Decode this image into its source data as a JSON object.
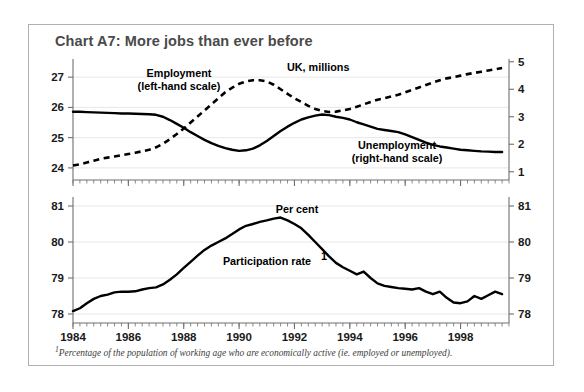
{
  "figure": {
    "title": "Chart A7: More jobs than ever before",
    "footnote_marker": "1",
    "footnote": "Percentage of the population of working age who are economically active (ie. employed or unemployed).",
    "border_color": "#b0b0b0",
    "title_color": "#4a4a4a"
  },
  "annotations": {
    "employment": "Employment",
    "employment_scale": "(left-hand scale)",
    "units_top": "UK, millions",
    "unemployment": "Unemployment",
    "unemployment_scale": "(right-hand scale)",
    "units_bottom": "Per cent",
    "participation": "Participation rate",
    "participation_marker": "1"
  },
  "chart_data": [
    {
      "type": "line",
      "title": "Employment and unemployment",
      "xlabel": "",
      "ylabel": "UK, millions",
      "xlim": [
        1984.0,
        1999.75
      ],
      "xticks": [
        1984,
        1986,
        1988,
        1990,
        1992,
        1994,
        1996,
        1998
      ],
      "xticklabels": [
        "1984",
        "1986",
        "1988",
        "1990",
        "1992",
        "1994",
        "1996",
        "1998"
      ],
      "minor_xtick_interval": 0.25,
      "ylim": [
        23.6,
        27.6
      ],
      "yticks": [
        24,
        25,
        26,
        27
      ],
      "yticklabels": [
        "24",
        "25",
        "26",
        "27"
      ],
      "y2lim": [
        0.7,
        5.1
      ],
      "y2ticks": [
        1,
        2,
        3,
        4,
        5
      ],
      "y2ticklabels": [
        "1",
        "2",
        "3",
        "4",
        "5"
      ],
      "grid": true,
      "legend": "in-plot annotations",
      "series": [
        {
          "name": "Employment",
          "axis": "left",
          "style": "dashed",
          "units": "millions",
          "x": [
            1984.0,
            1984.25,
            1984.5,
            1984.75,
            1985.0,
            1985.25,
            1985.5,
            1985.75,
            1986.0,
            1986.25,
            1986.5,
            1986.75,
            1987.0,
            1987.25,
            1987.5,
            1987.75,
            1988.0,
            1988.25,
            1988.5,
            1988.75,
            1989.0,
            1989.25,
            1989.5,
            1989.75,
            1990.0,
            1990.25,
            1990.5,
            1990.75,
            1991.0,
            1991.25,
            1991.5,
            1991.75,
            1992.0,
            1992.25,
            1992.5,
            1992.75,
            1993.0,
            1993.25,
            1993.5,
            1993.75,
            1994.0,
            1994.25,
            1994.5,
            1994.75,
            1995.0,
            1995.25,
            1995.5,
            1995.75,
            1996.0,
            1996.25,
            1996.5,
            1996.75,
            1997.0,
            1997.25,
            1997.5,
            1997.75,
            1998.0,
            1998.25,
            1998.5,
            1998.75,
            1999.0,
            1999.25,
            1999.5
          ],
          "values": [
            24.08,
            24.12,
            24.18,
            24.24,
            24.3,
            24.34,
            24.38,
            24.42,
            24.46,
            24.5,
            24.55,
            24.6,
            24.68,
            24.8,
            24.95,
            25.12,
            25.3,
            25.5,
            25.7,
            25.9,
            26.1,
            26.3,
            26.5,
            26.65,
            26.78,
            26.86,
            26.9,
            26.9,
            26.86,
            26.75,
            26.6,
            26.45,
            26.3,
            26.18,
            26.05,
            25.95,
            25.88,
            25.85,
            25.86,
            25.9,
            25.95,
            26.02,
            26.1,
            26.18,
            26.25,
            26.3,
            26.36,
            26.42,
            26.5,
            26.58,
            26.66,
            26.74,
            26.82,
            26.9,
            26.96,
            27.0,
            27.05,
            27.1,
            27.14,
            27.18,
            27.22,
            27.26,
            27.3
          ]
        },
        {
          "name": "Unemployment",
          "axis": "right",
          "style": "solid",
          "units": "millions",
          "x": [
            1984.0,
            1984.25,
            1984.5,
            1984.75,
            1985.0,
            1985.25,
            1985.5,
            1985.75,
            1986.0,
            1986.25,
            1986.5,
            1986.75,
            1987.0,
            1987.25,
            1987.5,
            1987.75,
            1988.0,
            1988.25,
            1988.5,
            1988.75,
            1989.0,
            1989.25,
            1989.5,
            1989.75,
            1990.0,
            1990.25,
            1990.5,
            1990.75,
            1991.0,
            1991.25,
            1991.5,
            1991.75,
            1992.0,
            1992.25,
            1992.5,
            1992.75,
            1993.0,
            1993.25,
            1993.5,
            1993.75,
            1994.0,
            1994.25,
            1994.5,
            1994.75,
            1995.0,
            1995.25,
            1995.5,
            1995.75,
            1996.0,
            1996.25,
            1996.5,
            1996.75,
            1997.0,
            1997.25,
            1997.5,
            1997.75,
            1998.0,
            1998.25,
            1998.5,
            1998.75,
            1999.0,
            1999.25,
            1999.5
          ],
          "values": [
            3.18,
            3.18,
            3.17,
            3.16,
            3.15,
            3.14,
            3.13,
            3.12,
            3.12,
            3.11,
            3.1,
            3.09,
            3.07,
            3.0,
            2.88,
            2.74,
            2.6,
            2.44,
            2.3,
            2.16,
            2.04,
            1.94,
            1.86,
            1.8,
            1.76,
            1.78,
            1.84,
            1.96,
            2.12,
            2.3,
            2.48,
            2.64,
            2.78,
            2.9,
            2.98,
            3.04,
            3.08,
            3.06,
            3.0,
            2.96,
            2.9,
            2.8,
            2.72,
            2.64,
            2.56,
            2.52,
            2.48,
            2.44,
            2.36,
            2.26,
            2.16,
            2.06,
            1.98,
            1.92,
            1.88,
            1.84,
            1.8,
            1.78,
            1.76,
            1.74,
            1.73,
            1.72,
            1.72
          ]
        }
      ]
    },
    {
      "type": "line",
      "title": "Participation rate",
      "xlabel": "",
      "ylabel": "Per cent",
      "xlim": [
        1984.0,
        1999.75
      ],
      "xticks": [
        1984,
        1986,
        1988,
        1990,
        1992,
        1994,
        1996,
        1998
      ],
      "xticklabels": [
        "1984",
        "1986",
        "1988",
        "1990",
        "1992",
        "1994",
        "1996",
        "1998"
      ],
      "minor_xtick_interval": 0.25,
      "ylim": [
        77.75,
        81.25
      ],
      "yticks": [
        78,
        79,
        80,
        81
      ],
      "yticklabels": [
        "78",
        "79",
        "80",
        "81"
      ],
      "y2ticks": [
        78,
        79,
        80,
        81
      ],
      "y2ticklabels": [
        "78",
        "79",
        "80",
        "81"
      ],
      "grid": true,
      "series": [
        {
          "name": "Participation rate",
          "axis": "left",
          "style": "solid",
          "units": "per cent",
          "x": [
            1984.0,
            1984.25,
            1984.5,
            1984.75,
            1985.0,
            1985.25,
            1985.5,
            1985.75,
            1986.0,
            1986.25,
            1986.5,
            1986.75,
            1987.0,
            1987.25,
            1987.5,
            1987.75,
            1988.0,
            1988.25,
            1988.5,
            1988.75,
            1989.0,
            1989.25,
            1989.5,
            1989.75,
            1990.0,
            1990.25,
            1990.5,
            1990.75,
            1991.0,
            1991.25,
            1991.5,
            1991.75,
            1992.0,
            1992.25,
            1992.5,
            1992.75,
            1993.0,
            1993.25,
            1993.5,
            1993.75,
            1994.0,
            1994.25,
            1994.5,
            1994.75,
            1995.0,
            1995.25,
            1995.5,
            1995.75,
            1996.0,
            1996.25,
            1996.5,
            1996.75,
            1997.0,
            1997.25,
            1997.5,
            1997.75,
            1998.0,
            1998.25,
            1998.5,
            1998.75,
            1999.0,
            1999.25,
            1999.5
          ],
          "values": [
            78.08,
            78.16,
            78.3,
            78.42,
            78.5,
            78.54,
            78.6,
            78.62,
            78.62,
            78.63,
            78.68,
            78.72,
            78.74,
            78.82,
            78.95,
            79.1,
            79.28,
            79.45,
            79.62,
            79.78,
            79.9,
            80.0,
            80.1,
            80.22,
            80.35,
            80.45,
            80.5,
            80.56,
            80.6,
            80.65,
            80.68,
            80.6,
            80.5,
            80.38,
            80.2,
            80.0,
            79.8,
            79.6,
            79.42,
            79.3,
            79.2,
            79.1,
            79.18,
            79.0,
            78.85,
            78.78,
            78.75,
            78.72,
            78.7,
            78.68,
            78.72,
            78.62,
            78.55,
            78.62,
            78.45,
            78.32,
            78.3,
            78.35,
            78.5,
            78.42,
            78.52,
            78.62,
            78.55
          ]
        }
      ]
    }
  ]
}
